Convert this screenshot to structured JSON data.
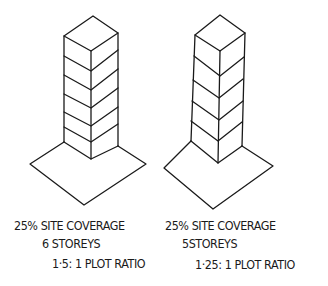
{
  "towers": [
    {
      "site_coverage": "25% SITE COVERAGE",
      "storeys_label": "6 STOREYS",
      "plot_ratio": "1·5: 1 PLOT RATIO",
      "storeys": 6
    },
    {
      "site_coverage": "25% SITE COVERAGE",
      "storeys_label": "5STOREYS",
      "plot_ratio": "1·25: 1 PLOT RATIO",
      "storeys": 5
    }
  ],
  "colors": {
    "ink": "#1a1a1a",
    "paper": "#ffffff"
  }
}
